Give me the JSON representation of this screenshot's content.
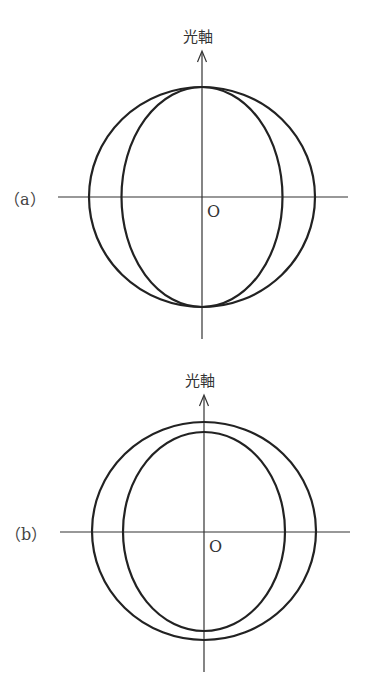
{
  "diagrams": [
    {
      "id": "a",
      "case_label": "（a）",
      "axis_label": "光軸",
      "origin_label": "O",
      "outer_circle": {
        "cx": 202,
        "cy": 197,
        "rx": 113,
        "ry": 110
      },
      "inner_ellipse": {
        "cx": 202,
        "cy": 197,
        "rx": 80.5,
        "ry": 110
      },
      "axes": {
        "h_x1": 58,
        "h_x2": 348,
        "h_y": 197,
        "v_x": 202,
        "v_y1": 50,
        "v_y2": 339
      },
      "stroke_color": "#222222"
    },
    {
      "id": "b",
      "case_label": "（b）",
      "axis_label": "光軸",
      "origin_label": "O",
      "outer_circle": {
        "cx": 204,
        "cy": 531,
        "rx": 112,
        "ry": 109
      },
      "inner_ellipse": {
        "cx": 204,
        "cy": 531.5,
        "rx": 81,
        "ry": 99.5
      },
      "axes": {
        "h_x1": 60,
        "h_x2": 350,
        "h_y": 532,
        "v_x": 204,
        "v_y1": 395,
        "v_y2": 672
      },
      "stroke_color": "#222222"
    }
  ]
}
